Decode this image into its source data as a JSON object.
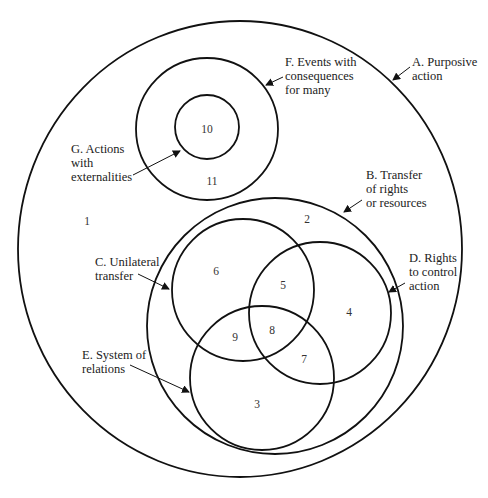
{
  "diagram": {
    "circles": [
      {
        "id": "A",
        "label_lines": [
          "A. Purposive",
          "action"
        ]
      },
      {
        "id": "B",
        "label_lines": [
          "B.  Transfer",
          "of rights",
          "or resources"
        ]
      },
      {
        "id": "C",
        "label_lines": [
          "C.  Unilateral",
          "transfer"
        ]
      },
      {
        "id": "D",
        "label_lines": [
          "D.  Rights",
          "to control",
          "action"
        ]
      },
      {
        "id": "E",
        "label_lines": [
          "E.  System of",
          "relations"
        ]
      },
      {
        "id": "F",
        "label_lines": [
          "F.  Events with",
          "consequences",
          "for many"
        ]
      },
      {
        "id": "G",
        "label_lines": [
          "G.  Actions",
          "with",
          "externalities"
        ]
      }
    ],
    "regions": [
      "1",
      "2",
      "3",
      "4",
      "5",
      "6",
      "7",
      "8",
      "9",
      "10",
      "11"
    ]
  }
}
